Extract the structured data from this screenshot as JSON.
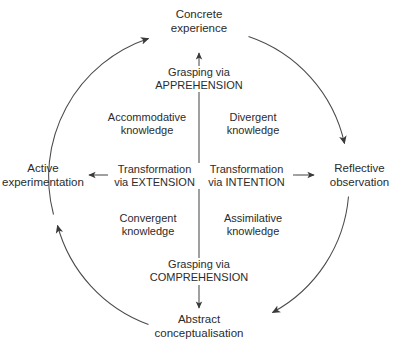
{
  "diagram": {
    "colors": {
      "text": "#2b2b2b",
      "line": "#4a4a4a",
      "background": "#ffffff"
    },
    "poles": {
      "top": {
        "line1": "Concrete",
        "line2": "experience"
      },
      "right": {
        "line1": "Reflective",
        "line2": "observation"
      },
      "bottom": {
        "line1": "Abstract",
        "line2": "conceptualisation"
      },
      "left": {
        "line1": "Active",
        "line2": "experimentation"
      }
    },
    "axes": {
      "top": {
        "line1": "Grasping via",
        "line2": "APPREHENSION"
      },
      "bottom": {
        "line1": "Grasping via",
        "line2": "COMPREHENSION"
      },
      "left": {
        "line1": "Transformation",
        "line2": "via EXTENSION"
      },
      "right": {
        "line1": "Transformation",
        "line2": "via INTENTION"
      }
    },
    "quadrants": {
      "top_left": {
        "line1": "Accommodative",
        "line2": "knowledge"
      },
      "top_right": {
        "line1": "Divergent",
        "line2": "knowledge"
      },
      "bottom_left": {
        "line1": "Convergent",
        "line2": "knowledge"
      },
      "bottom_right": {
        "line1": "Assimilative",
        "line2": "knowledge"
      }
    },
    "arcs": [
      {
        "name": "left-to-top",
        "direction": "clockwise",
        "from": "Active experimentation",
        "to": "Concrete experience"
      },
      {
        "name": "top-to-right",
        "direction": "clockwise",
        "from": "Concrete experience",
        "to": "Reflective observation"
      },
      {
        "name": "right-to-bottom",
        "direction": "clockwise",
        "from": "Reflective observation",
        "to": "Abstract conceptualisation"
      },
      {
        "name": "bottom-to-left",
        "direction": "clockwise",
        "from": "Abstract conceptualisation",
        "to": "Active experimentation"
      }
    ]
  }
}
